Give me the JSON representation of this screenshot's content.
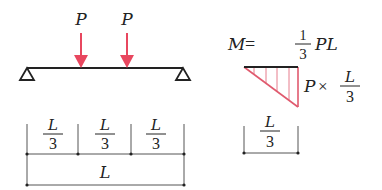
{
  "colors": {
    "load": "#e8475f",
    "moment": "#e05a6e",
    "line": "#222222",
    "dim": "#555555",
    "background": "#ffffff"
  },
  "beam": {
    "load_labels": [
      "P",
      "P"
    ],
    "supports": [
      "pin-support",
      "roller-support"
    ]
  },
  "dimensions": {
    "segments": [
      {
        "num": "L",
        "den": "3"
      },
      {
        "num": "L",
        "den": "3"
      },
      {
        "num": "L",
        "den": "3"
      }
    ],
    "total": "L"
  },
  "moment": {
    "lhs": "M",
    "eq": "=",
    "coef_num": "1",
    "coef_den": "3",
    "rhs": "PL",
    "side_P": "P",
    "side_times": "×",
    "side_num": "L",
    "side_den": "3",
    "base_num": "L",
    "base_den": "3"
  }
}
